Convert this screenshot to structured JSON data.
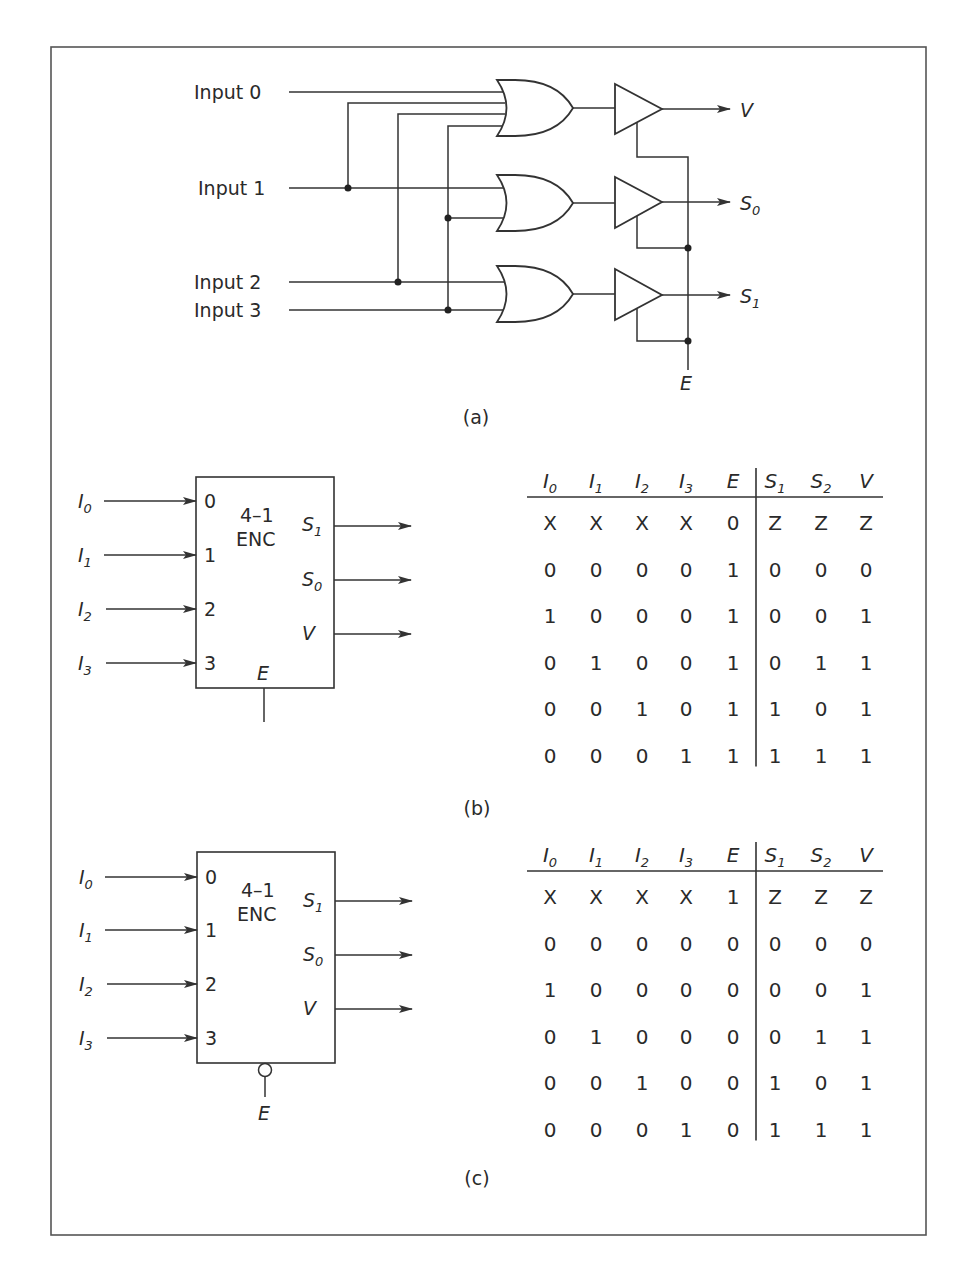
{
  "figure": {
    "frame": {
      "left": 51,
      "top": 47,
      "right": 926,
      "bottom": 1235
    },
    "colors": {
      "ink": "#2a2a2a",
      "background": "#ffffff"
    }
  },
  "panel_a": {
    "caption": "(a)",
    "inputs": [
      "Input 0",
      "Input 1",
      "Input 2",
      "Input 3"
    ],
    "outputs": [
      {
        "label": "V",
        "sub": ""
      },
      {
        "label": "S",
        "sub": "0"
      },
      {
        "label": "S",
        "sub": "1"
      }
    ],
    "enable_label": "E",
    "gates": [
      "or-gate-v",
      "or-gate-s0",
      "or-gate-s1"
    ],
    "buffers": [
      "tristate-buffer-v",
      "tristate-buffer-s0",
      "tristate-buffer-s1"
    ]
  },
  "panel_b": {
    "caption": "(b)",
    "block": {
      "title_line1": "4–1",
      "title_line2": "ENC",
      "input_pins": [
        "0",
        "1",
        "2",
        "3"
      ],
      "input_labels": [
        {
          "label": "I",
          "sub": "0"
        },
        {
          "label": "I",
          "sub": "1"
        },
        {
          "label": "I",
          "sub": "2"
        },
        {
          "label": "I",
          "sub": "3"
        }
      ],
      "output_labels": [
        {
          "label": "S",
          "sub": "1"
        },
        {
          "label": "S",
          "sub": "0"
        },
        {
          "label": "V",
          "sub": ""
        }
      ],
      "enable_label": "E",
      "enable_active_low": false
    },
    "table": {
      "headers": [
        {
          "label": "I",
          "sub": "0"
        },
        {
          "label": "I",
          "sub": "1"
        },
        {
          "label": "I",
          "sub": "2"
        },
        {
          "label": "I",
          "sub": "3"
        },
        {
          "label": "E",
          "sub": ""
        },
        {
          "label": "S",
          "sub": "1"
        },
        {
          "label": "S",
          "sub": "2"
        },
        {
          "label": "V",
          "sub": ""
        }
      ],
      "rows": [
        [
          "X",
          "X",
          "X",
          "X",
          "0",
          "Z",
          "Z",
          "Z"
        ],
        [
          "0",
          "0",
          "0",
          "0",
          "1",
          "0",
          "0",
          "0"
        ],
        [
          "1",
          "0",
          "0",
          "0",
          "1",
          "0",
          "0",
          "1"
        ],
        [
          "0",
          "1",
          "0",
          "0",
          "1",
          "0",
          "1",
          "1"
        ],
        [
          "0",
          "0",
          "1",
          "0",
          "1",
          "1",
          "0",
          "1"
        ],
        [
          "0",
          "0",
          "0",
          "1",
          "1",
          "1",
          "1",
          "1"
        ]
      ]
    }
  },
  "panel_c": {
    "caption": "(c)",
    "block": {
      "title_line1": "4–1",
      "title_line2": "ENC",
      "input_pins": [
        "0",
        "1",
        "2",
        "3"
      ],
      "input_labels": [
        {
          "label": "I",
          "sub": "0"
        },
        {
          "label": "I",
          "sub": "1"
        },
        {
          "label": "I",
          "sub": "2"
        },
        {
          "label": "I",
          "sub": "3"
        }
      ],
      "output_labels": [
        {
          "label": "S",
          "sub": "1"
        },
        {
          "label": "S",
          "sub": "0"
        },
        {
          "label": "V",
          "sub": ""
        }
      ],
      "enable_label": "E",
      "enable_active_low": true
    },
    "table": {
      "headers": [
        {
          "label": "I",
          "sub": "0"
        },
        {
          "label": "I",
          "sub": "1"
        },
        {
          "label": "I",
          "sub": "2"
        },
        {
          "label": "I",
          "sub": "3"
        },
        {
          "label": "E",
          "sub": ""
        },
        {
          "label": "S",
          "sub": "1"
        },
        {
          "label": "S",
          "sub": "2"
        },
        {
          "label": "V",
          "sub": ""
        }
      ],
      "rows": [
        [
          "X",
          "X",
          "X",
          "X",
          "1",
          "Z",
          "Z",
          "Z"
        ],
        [
          "0",
          "0",
          "0",
          "0",
          "0",
          "0",
          "0",
          "0"
        ],
        [
          "1",
          "0",
          "0",
          "0",
          "0",
          "0",
          "0",
          "1"
        ],
        [
          "0",
          "1",
          "0",
          "0",
          "0",
          "0",
          "1",
          "1"
        ],
        [
          "0",
          "0",
          "1",
          "0",
          "0",
          "1",
          "0",
          "1"
        ],
        [
          "0",
          "0",
          "0",
          "1",
          "0",
          "1",
          "1",
          "1"
        ]
      ]
    }
  }
}
